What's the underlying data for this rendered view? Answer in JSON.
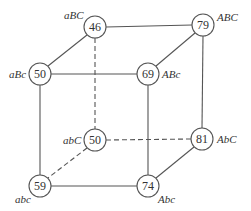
{
  "diagram": {
    "type": "cube-factorial-design",
    "nodes": [
      {
        "id": "aBC",
        "label": "aBC",
        "value": "46"
      },
      {
        "id": "ABC",
        "label": "ABC",
        "value": "79"
      },
      {
        "id": "aBc",
        "label": "aBc",
        "value": "50"
      },
      {
        "id": "ABc",
        "label": "ABc",
        "value": "69"
      },
      {
        "id": "abC",
        "label": "abC",
        "value": "50"
      },
      {
        "id": "AbC",
        "label": "AbC",
        "value": "81"
      },
      {
        "id": "abc",
        "label": "abc",
        "value": "59"
      },
      {
        "id": "Abc",
        "label": "Abc",
        "value": "74"
      }
    ],
    "colors": {
      "line": "#555555",
      "text": "#333333",
      "background": "#ffffff"
    }
  }
}
